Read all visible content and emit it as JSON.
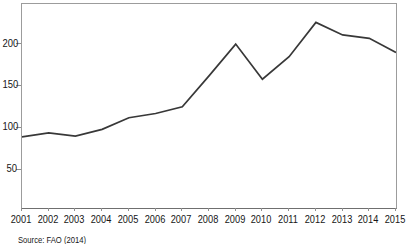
{
  "chart_data": {
    "type": "line",
    "title": "",
    "xlabel": "",
    "ylabel": "",
    "x": [
      "2001",
      "2002",
      "2003",
      "2004",
      "2005",
      "2006",
      "2007",
      "2008",
      "2009",
      "2010",
      "2011",
      "2012",
      "2013",
      "2014",
      "2015"
    ],
    "series": [
      {
        "name": "index",
        "values": [
          89,
          94,
          90,
          98,
          112,
          117,
          125,
          162,
          200,
          158,
          185,
          226,
          211,
          207,
          190
        ]
      }
    ],
    "ylim": [
      4,
      248
    ],
    "yticks": [
      50,
      100,
      150,
      200
    ],
    "grid": false,
    "legend": "none",
    "line_color": "#383838",
    "axis_color": "#8f8f8f",
    "tick_label_color": "#161616"
  },
  "source_note": "Source: FAO (2014)"
}
